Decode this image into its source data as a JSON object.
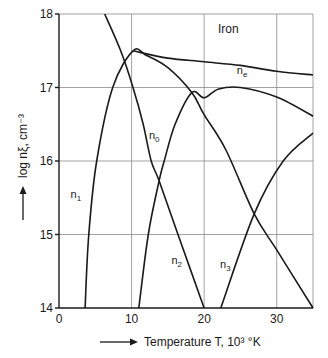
{
  "chart_data": {
    "type": "line",
    "title": "Iron",
    "xlabel": "Temperature T, 10³ °K",
    "ylabel": "log nξ, cm⁻³",
    "xlim": [
      0,
      35
    ],
    "ylim": [
      14,
      18
    ],
    "xticks": [
      0,
      10,
      20,
      30
    ],
    "xtick_labels": [
      "0",
      "10",
      "20",
      "30"
    ],
    "yticks": [
      14,
      15,
      16,
      17,
      18
    ],
    "ytick_labels": [
      "14",
      "15",
      "16",
      "17",
      "18"
    ],
    "grid": true,
    "legend": "none (inline labels)",
    "series": [
      {
        "name": "n0",
        "label": "n",
        "sub": "0",
        "x": [
          6.3,
          8.5,
          10.2,
          11.6,
          12.7,
          13.8,
          16.4,
          20
        ],
        "y": [
          18,
          17.5,
          17,
          16.5,
          16,
          15.73,
          15,
          14
        ],
        "label_at": [
          12.4,
          16.3
        ]
      },
      {
        "name": "n1",
        "label": "n",
        "sub": "1",
        "x": [
          3.6,
          4.1,
          5.2,
          7.4,
          10.2,
          12,
          15,
          18.3,
          20,
          23,
          26.9,
          30,
          35
        ],
        "y": [
          14,
          15,
          16,
          17,
          17.5,
          17.44,
          17.27,
          16.93,
          16.63,
          16.15,
          15.28,
          14.79,
          14
        ],
        "label_at": [
          1.6,
          15.5
        ]
      },
      {
        "name": "n2",
        "label": "n",
        "sub": "2",
        "x": [
          11,
          12.3,
          13.8,
          14.5,
          16,
          18.3,
          20,
          22,
          25,
          30,
          35
        ],
        "y": [
          14,
          15,
          15.73,
          16,
          16.5,
          16.93,
          16.86,
          16.98,
          17.0,
          16.87,
          16.61
        ],
        "label_at": [
          15.5,
          14.6
        ]
      },
      {
        "name": "n3",
        "label": "n",
        "sub": "3",
        "x": [
          22.3,
          26.9,
          30.9,
          35
        ],
        "y": [
          14,
          15.28,
          16,
          16.38
        ],
        "label_at": [
          22.2,
          14.55
        ]
      },
      {
        "name": "ne",
        "label": "n",
        "sub": "e",
        "x": [
          10.2,
          15,
          20,
          25,
          30,
          35
        ],
        "y": [
          17.5,
          17.4,
          17.35,
          17.3,
          17.22,
          17.17
        ],
        "label_at": [
          24.5,
          17.18
        ]
      }
    ]
  },
  "labels": {
    "title": "Iron",
    "xlabel": "Temperature T, 10³ °K",
    "ylabel": "log nξ, cm⁻³"
  }
}
